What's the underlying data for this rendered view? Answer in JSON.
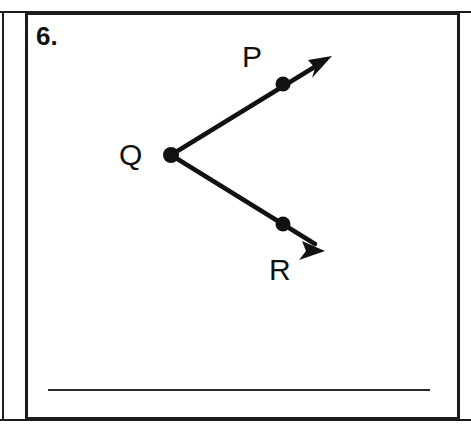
{
  "worksheet": {
    "problem_number": "6.",
    "answer_line_present": true
  },
  "figure": {
    "type": "angle-diagram",
    "stroke_color": "#111111",
    "labels": {
      "P": "P",
      "Q": "Q",
      "R": "R"
    },
    "points": {
      "Q": {
        "x": 146,
        "y": 143,
        "radius": 7.5
      },
      "P": {
        "x": 258,
        "y": 72,
        "radius": 7.5
      },
      "R": {
        "x": 258,
        "y": 212,
        "radius": 7.5
      }
    },
    "rays": [
      {
        "name": "ray-QP",
        "from": "Q",
        "through": "P",
        "tip_x": 307,
        "tip_y": 44
      },
      {
        "name": "ray-QR",
        "from": "Q",
        "through": "R",
        "tip_x": 300,
        "tip_y": 239
      }
    ]
  }
}
